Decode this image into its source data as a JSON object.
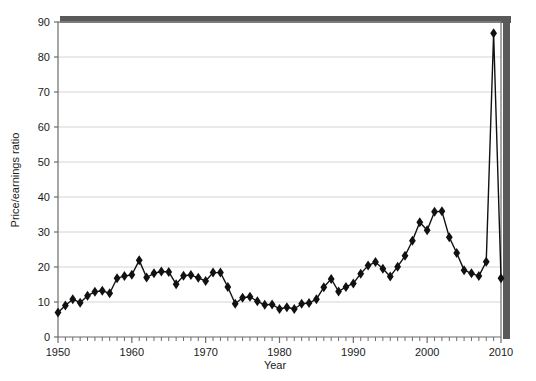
{
  "chart_data": {
    "type": "line",
    "title": "",
    "subtitle": "",
    "xlabel": "Year",
    "ylabel": "Price/earnings ratio",
    "xlim": [
      1950,
      2010
    ],
    "ylim": [
      0,
      90
    ],
    "xticks": [
      1950,
      1960,
      1970,
      1980,
      1990,
      2000,
      2010
    ],
    "xtick_labels": [
      "1950",
      "1960",
      "1970",
      "1980",
      "1990",
      "2000",
      "2010"
    ],
    "x_minor_tick_step": 1,
    "yticks": [
      0,
      10,
      20,
      30,
      40,
      50,
      60,
      70,
      80,
      90
    ],
    "ytick_labels": [
      "0",
      "10",
      "20",
      "30",
      "40",
      "50",
      "60",
      "70",
      "80",
      "90"
    ],
    "grid": "horizontal",
    "grid_color": "#cfcfcf",
    "legend": "none",
    "legend_position": "none",
    "marker": "diamond",
    "marker_color": "#111111",
    "line_color": "#111111",
    "frame_shadow_color": "#595959",
    "plot_background": "#ffffff",
    "series": [
      {
        "name": "Price/earnings ratio",
        "x": [
          1950,
          1951,
          1952,
          1953,
          1954,
          1955,
          1956,
          1957,
          1958,
          1959,
          1960,
          1961,
          1962,
          1963,
          1964,
          1965,
          1966,
          1967,
          1968,
          1969,
          1970,
          1971,
          1972,
          1973,
          1974,
          1975,
          1976,
          1977,
          1978,
          1979,
          1980,
          1981,
          1982,
          1983,
          1984,
          1985,
          1986,
          1987,
          1988,
          1989,
          1990,
          1991,
          1992,
          1993,
          1994,
          1995,
          1996,
          1997,
          1998,
          1999,
          2000,
          2001,
          2002,
          2003,
          2004,
          2005,
          2006,
          2007,
          2008,
          2009,
          2010
        ],
        "values": [
          7.0,
          9.0,
          10.8,
          9.8,
          11.8,
          12.9,
          13.2,
          12.5,
          16.8,
          17.4,
          17.8,
          21.9,
          17.0,
          18.2,
          18.7,
          18.6,
          15.1,
          17.5,
          17.7,
          16.9,
          16.0,
          18.4,
          18.4,
          14.3,
          9.5,
          11.2,
          11.5,
          10.2,
          9.2,
          9.3,
          8.0,
          8.5,
          8.0,
          9.5,
          9.7,
          10.8,
          14.2,
          16.6,
          13.0,
          14.3,
          15.3,
          18.1,
          20.4,
          21.4,
          19.5,
          17.3,
          20.1,
          23.2,
          27.5,
          32.8,
          30.5,
          35.8,
          35.9,
          28.5,
          24.0,
          19.1,
          18.2,
          17.4,
          21.5,
          86.8,
          16.8
        ]
      }
    ]
  },
  "figure": {
    "background_color": "#ffffff",
    "axis_color": "#6b6b6b",
    "text_color": "#1b1b1b"
  }
}
